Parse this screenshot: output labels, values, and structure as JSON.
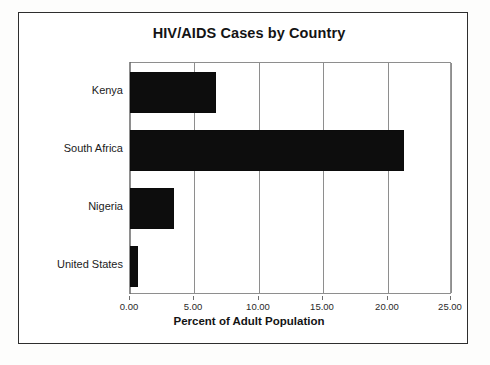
{
  "chart_data": {
    "type": "bar",
    "orientation": "horizontal",
    "title": "HIV/AIDS Cases by Country",
    "xlabel": "Percent of Adult Population",
    "ylabel": "",
    "categories": [
      "Kenya",
      "South Africa",
      "Nigeria",
      "United States"
    ],
    "values": [
      6.7,
      21.3,
      3.4,
      0.6
    ],
    "xlim": [
      0,
      25
    ],
    "xticks": [
      0,
      5,
      10,
      15,
      20,
      25
    ],
    "xtick_labels": [
      "0.00",
      "5.00",
      "10.00",
      "15.00",
      "20.00",
      "25.00"
    ],
    "grid": "vertical",
    "legend": null,
    "bar_color": "#0d0d0d",
    "background_color": "#ffffff",
    "grid_color": "#8e8e8e"
  },
  "frame": {
    "border_color": "#2e2e2e"
  }
}
